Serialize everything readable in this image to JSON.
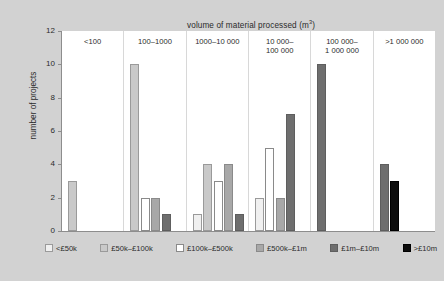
{
  "chart_data": {
    "type": "bar",
    "title": "volume of material processed (m3)",
    "title_main": "volume of material processed (m",
    "title_sup": "3",
    "title_tail": ")",
    "xlabel": "",
    "ylabel": "number of projects",
    "ylim": [
      0,
      12
    ],
    "yticks": [
      "0",
      "2",
      "4",
      "6",
      "8",
      "10",
      "12"
    ],
    "grid": false,
    "legend_position": "bottom",
    "panels": [
      {
        "label": "<100",
        "label_line1": "<100",
        "label_line2": ""
      },
      {
        "label": "100–1000",
        "label_line1": "100–1000",
        "label_line2": ""
      },
      {
        "label": "1000–10 000",
        "label_line1": "1000–10 000",
        "label_line2": ""
      },
      {
        "label": "10 000–100 000",
        "label_line1": "10 000–",
        "label_line2": "100 000"
      },
      {
        "label": "100 000–1 000 000",
        "label_line1": "100 000–",
        "label_line2": "1 000 000"
      },
      {
        "label": ">1 000 000",
        "label_line1": ">1 000 000",
        "label_line2": ""
      }
    ],
    "categories": [
      "<100",
      "100–1000",
      "1000–10 000",
      "10 000–100 000",
      "100 000–1 000 000",
      ">1 000 000"
    ],
    "series": [
      {
        "name": "<£50k",
        "color": "#f0f0f0",
        "values": [
          0,
          0,
          1,
          2,
          0,
          0
        ]
      },
      {
        "name": "£50k–£100k",
        "color": "#c9c9c9",
        "values": [
          3,
          10,
          4,
          0,
          0,
          0
        ]
      },
      {
        "name": "£100k–£500k",
        "color": "#ffffff",
        "values": [
          0,
          2,
          3,
          5,
          0,
          0
        ]
      },
      {
        "name": "£500k–£1m",
        "color": "#a8a8a8",
        "values": [
          0,
          2,
          4,
          2,
          0,
          0
        ]
      },
      {
        "name": "£1m–£10m",
        "color": "#6e6e6e",
        "values": [
          0,
          1,
          1,
          7,
          10,
          4
        ]
      },
      {
        "name": ">£10m",
        "color": "#0d0d0d",
        "values": [
          0,
          0,
          0,
          0,
          0,
          3
        ]
      }
    ]
  },
  "legend": {
    "items": [
      {
        "label": "<£50k"
      },
      {
        "label": "£50k–£100k"
      },
      {
        "label": "£100k–£500k"
      },
      {
        "label": "£500k–£1m"
      },
      {
        "label": "£1m–£10m"
      },
      {
        "label": ">£10m"
      }
    ]
  },
  "caption": ""
}
